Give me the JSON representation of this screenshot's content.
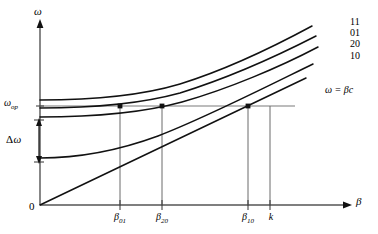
{
  "figure": {
    "type": "dispersion-diagram",
    "background_color": "#ffffff",
    "line_color": "#1a1a1a",
    "guide_color": "#6e6e6e"
  },
  "axes": {
    "y_label": "ω",
    "x_label": "β",
    "origin_label": "0",
    "y_axis_x": 40,
    "x_axis_y": 205,
    "y_axis_top": 22,
    "x_axis_right": 352
  },
  "y_markers": {
    "omega_op": {
      "symbol": "ω",
      "subscript": "op",
      "y": 106
    },
    "delta_omega": {
      "symbol": "Δ",
      "omega": "ω",
      "top_y": 120,
      "bottom_y": 162
    }
  },
  "x_ticks": [
    {
      "name": "beta-01",
      "symbol": "β",
      "subscript": "01",
      "x": 120
    },
    {
      "name": "beta-20",
      "symbol": "β",
      "subscript": "20",
      "x": 162
    },
    {
      "name": "beta-10",
      "symbol": "β",
      "subscript": "10",
      "x": 248
    },
    {
      "name": "wavenumber-k",
      "symbol": "k",
      "subscript": "",
      "x": 270
    }
  ],
  "curves": [
    {
      "name": "mode-11",
      "label": "11",
      "label_x": 350,
      "label_y": 17,
      "path": "M 40 100 C 95 100, 140 96, 180 84 C 225 70, 275 46, 312 26",
      "cutoff_y": 100
    },
    {
      "name": "mode-01",
      "label": "01",
      "label_x": 350,
      "label_y": 28,
      "path": "M 40 108 C 95 108, 140 104, 180 93 C 225 79, 277 56, 316 36",
      "cutoff_y": 108
    },
    {
      "name": "mode-20",
      "label": "20",
      "label_x": 350,
      "label_y": 39,
      "path": "M 40 117 C 95 117, 142 113, 182 102 C 228 89, 280 67, 318 47",
      "cutoff_y": 117
    },
    {
      "name": "mode-10",
      "label": "10",
      "label_x": 350,
      "label_y": 51,
      "path": "M 40 158 C 80 158, 120 150, 158 136 C 205 118, 268 86, 313 64",
      "cutoff_y": 158
    }
  ],
  "light_line": {
    "name": "light-line",
    "label": "ω = βc",
    "label_x": 325,
    "label_y": 85,
    "from": {
      "x": 40,
      "y": 205
    },
    "to": {
      "x": 306,
      "y": 78
    }
  },
  "intersection_dots": [
    {
      "name": "dot-beta-01",
      "x": 120,
      "y": 106
    },
    {
      "name": "dot-beta-20",
      "x": 162,
      "y": 106
    },
    {
      "name": "dot-beta-10",
      "x": 248,
      "y": 106
    }
  ],
  "guide_lines": {
    "horizontal_omega_op": {
      "x1": 40,
      "x2": 295,
      "y": 106
    },
    "verticals": [
      {
        "name": "vline-beta-01",
        "x": 120,
        "y_top": 106,
        "y_bottom": 205
      },
      {
        "name": "vline-beta-20",
        "x": 162,
        "y_top": 106,
        "y_bottom": 205
      },
      {
        "name": "vline-beta-10",
        "x": 248,
        "y_top": 106,
        "y_bottom": 205
      },
      {
        "name": "vline-k",
        "x": 270,
        "y_top": 106,
        "y_bottom": 205
      }
    ]
  }
}
